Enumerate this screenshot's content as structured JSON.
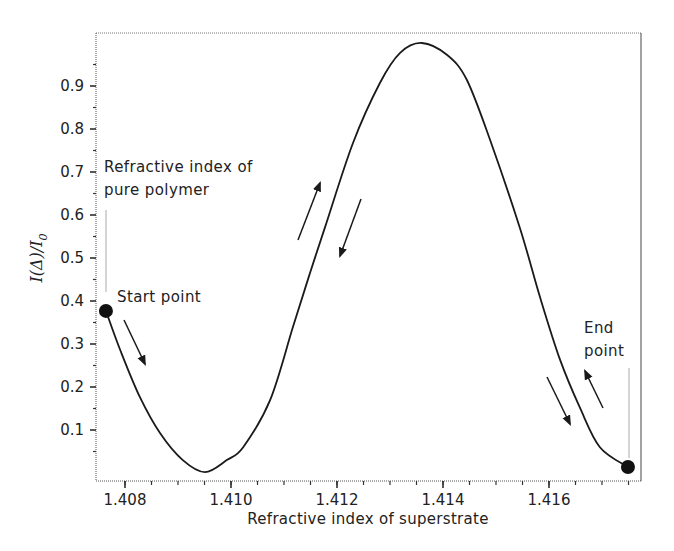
{
  "chart_data": {
    "type": "line",
    "title": "",
    "xlabel": "Refractive index of superstrate",
    "ylabel": "I(Δ)/I0",
    "ylabel_parts": {
      "main": "I(Δ)/I",
      "sub": "0"
    },
    "xlim": [
      1.4076,
      1.4178
    ],
    "ylim": [
      -0.02,
      1.025
    ],
    "grid": false,
    "legend": null,
    "x_ticks": [
      1.408,
      1.41,
      1.412,
      1.414,
      1.416
    ],
    "x_tick_labels": [
      "1.408",
      "1.410",
      "1.412",
      "1.414",
      "1.416"
    ],
    "y_ticks": [
      0.1,
      0.2,
      0.3,
      0.4,
      0.5,
      0.6,
      0.7,
      0.8,
      0.9
    ],
    "y_tick_labels": [
      "0.1",
      "0.2",
      "0.3",
      "0.4",
      "0.5",
      "0.6",
      "0.7",
      "0.8",
      "0.9"
    ],
    "series": [
      {
        "name": "I(Δ)/I0",
        "x": [
          1.40764,
          1.40791,
          1.40828,
          1.40866,
          1.40909,
          1.40951,
          1.40992,
          1.41023,
          1.41074,
          1.41117,
          1.41149,
          1.41177,
          1.4123,
          1.41281,
          1.41319,
          1.4136,
          1.41408,
          1.41445,
          1.41489,
          1.41545,
          1.41583,
          1.41621,
          1.41658,
          1.41696,
          1.41749
        ],
        "y": [
          0.377,
          0.286,
          0.177,
          0.093,
          0.03,
          0.002,
          0.03,
          0.06,
          0.17,
          0.34,
          0.465,
          0.57,
          0.767,
          0.907,
          0.977,
          1.0,
          0.972,
          0.914,
          0.774,
          0.57,
          0.409,
          0.263,
          0.153,
          0.06,
          0.014
        ]
      }
    ],
    "markers": [
      {
        "name": "start",
        "x": 1.40764,
        "y": 0.377,
        "label": "Start point"
      },
      {
        "name": "end",
        "x": 1.41749,
        "y": 0.014,
        "label": "End point"
      }
    ],
    "annotations": [
      {
        "text": "Refractive index of",
        "line2": "pure polymer",
        "x": 1.40764
      },
      {
        "text": "Start point"
      },
      {
        "text": "End",
        "line2": "point"
      }
    ]
  },
  "labels": {
    "pure_polymer_line1": "Refractive index of",
    "pure_polymer_line2": "pure polymer",
    "start_point": "Start point",
    "end_point_line1": "End",
    "end_point_line2": "point"
  }
}
